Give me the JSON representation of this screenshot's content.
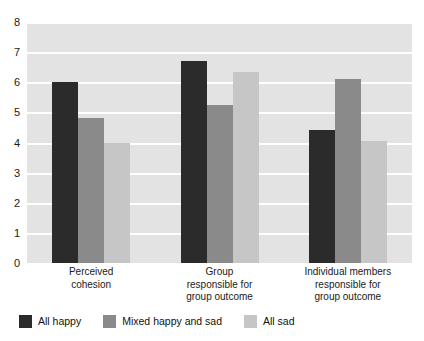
{
  "chart_data": {
    "type": "bar",
    "title": "",
    "xlabel": "",
    "ylabel": "",
    "ylim": [
      0,
      8
    ],
    "ytick_labels": [
      "8",
      "7",
      "6",
      "5",
      "4",
      "3",
      "2",
      "1",
      "0"
    ],
    "ytick_values": [
      8,
      7,
      6,
      5,
      4,
      3,
      2,
      1,
      0
    ],
    "grid": true,
    "legend_position": "bottom-left",
    "categories": [
      "Perceived cohesion",
      "Group responsible for group outcome",
      "Individual members responsible for group outcome"
    ],
    "category_lines": [
      [
        "Perceived",
        "cohesion"
      ],
      [
        "Group",
        "responsible for",
        "group outcome"
      ],
      [
        "Individual members",
        "responsible for",
        "group outcome"
      ]
    ],
    "series": [
      {
        "name": "All happy",
        "color": "#2b2b2b",
        "values": [
          6.0,
          6.7,
          4.4
        ]
      },
      {
        "name": "Mixed happy and sad",
        "color": "#8a8a8a",
        "values": [
          4.8,
          5.25,
          6.1
        ]
      },
      {
        "name": "All sad",
        "color": "#c6c6c6",
        "values": [
          4.0,
          6.35,
          4.05
        ]
      }
    ],
    "plot_background": "#e3e3e3",
    "gridline_color": "#ffffff"
  },
  "legend": {
    "items": [
      {
        "label": "All happy",
        "color": "#2b2b2b"
      },
      {
        "label": "Mixed happy and sad",
        "color": "#8a8a8a"
      },
      {
        "label": "All sad",
        "color": "#c6c6c6"
      }
    ]
  }
}
